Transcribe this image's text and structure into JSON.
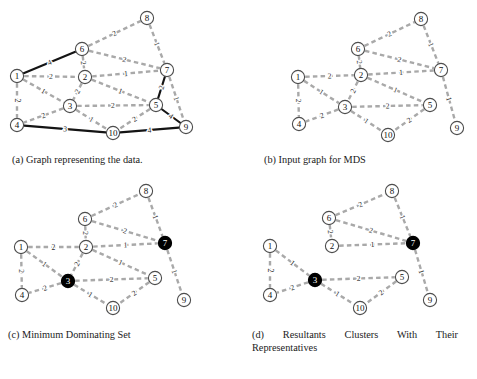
{
  "figure": {
    "colors": {
      "dashed_edge": "#a9a9a9",
      "solid_edge": "#141414",
      "node_fill": "#ffffff",
      "node_stroke": "#4d4d4d",
      "node_selected_fill": "#000000",
      "label_text": "#111111",
      "weight_text": "#2a2a2a",
      "background": "#ffffff"
    },
    "node_ids": [
      "1",
      "2",
      "3",
      "4",
      "5",
      "6",
      "7",
      "8",
      "9",
      "10"
    ]
  },
  "panels": [
    {
      "key": "a",
      "caption": "(a) Graph representing the data.",
      "selected_nodes": [],
      "nodes": [
        {
          "id": "1",
          "x": 17,
          "y": 76
        },
        {
          "id": "2",
          "x": 85,
          "y": 77
        },
        {
          "id": "3",
          "x": 70,
          "y": 106
        },
        {
          "id": "4",
          "x": 17,
          "y": 125
        },
        {
          "id": "5",
          "x": 156,
          "y": 105
        },
        {
          "id": "6",
          "x": 82,
          "y": 49
        },
        {
          "id": "7",
          "x": 167,
          "y": 70
        },
        {
          "id": "8",
          "x": 147,
          "y": 18
        },
        {
          "id": "9",
          "x": 186,
          "y": 127
        },
        {
          "id": "10",
          "x": 113,
          "y": 133
        }
      ],
      "edges": [
        {
          "from": "1",
          "to": "6",
          "w": "4",
          "style": "solid"
        },
        {
          "from": "1",
          "to": "2",
          "w": "2",
          "style": "dashed"
        },
        {
          "from": "1",
          "to": "3",
          "w": "1",
          "style": "dashed"
        },
        {
          "from": "1",
          "to": "4",
          "w": "2",
          "style": "dashed"
        },
        {
          "from": "6",
          "to": "2",
          "w": "2",
          "style": "dashed"
        },
        {
          "from": "6",
          "to": "8",
          "w": "2",
          "style": "dashed"
        },
        {
          "from": "6",
          "to": "7",
          "w": "2",
          "style": "dashed"
        },
        {
          "from": "8",
          "to": "7",
          "w": "1",
          "style": "dashed"
        },
        {
          "from": "2",
          "to": "7",
          "w": "1",
          "style": "dashed"
        },
        {
          "from": "2",
          "to": "3",
          "w": "2",
          "style": "dashed"
        },
        {
          "from": "2",
          "to": "5",
          "w": "1",
          "style": "dashed"
        },
        {
          "from": "3",
          "to": "5",
          "w": "2",
          "style": "dashed"
        },
        {
          "from": "3",
          "to": "4",
          "w": "2",
          "style": "dashed"
        },
        {
          "from": "3",
          "to": "10",
          "w": "1",
          "style": "dashed"
        },
        {
          "from": "5",
          "to": "10",
          "w": "2",
          "style": "dashed"
        },
        {
          "from": "5",
          "to": "7",
          "w": "2",
          "style": "solid"
        },
        {
          "from": "5",
          "to": "9",
          "w": "4",
          "style": "solid"
        },
        {
          "from": "7",
          "to": "9",
          "w": "1",
          "style": "dashed"
        },
        {
          "from": "4",
          "to": "10",
          "w": "3",
          "style": "solid"
        },
        {
          "from": "10",
          "to": "9",
          "w": "4",
          "style": "solid"
        }
      ]
    },
    {
      "key": "b",
      "caption": "(b) Input graph for MDS",
      "selected_nodes": [],
      "nodes": [
        {
          "id": "1",
          "x": 58,
          "y": 77
        },
        {
          "id": "2",
          "x": 121,
          "y": 75
        },
        {
          "id": "3",
          "x": 105,
          "y": 107
        },
        {
          "id": "4",
          "x": 59,
          "y": 124
        },
        {
          "id": "5",
          "x": 190,
          "y": 105
        },
        {
          "id": "6",
          "x": 118,
          "y": 49
        },
        {
          "id": "7",
          "x": 201,
          "y": 70
        },
        {
          "id": "8",
          "x": 181,
          "y": 19
        },
        {
          "id": "9",
          "x": 217,
          "y": 128
        },
        {
          "id": "10",
          "x": 148,
          "y": 135
        }
      ],
      "edges": [
        {
          "from": "1",
          "to": "2",
          "w": "2",
          "style": "dashed"
        },
        {
          "from": "1",
          "to": "3",
          "w": "1",
          "style": "dashed"
        },
        {
          "from": "1",
          "to": "4",
          "w": "2",
          "style": "dashed"
        },
        {
          "from": "6",
          "to": "2",
          "w": "2",
          "style": "dashed"
        },
        {
          "from": "6",
          "to": "8",
          "w": "2",
          "style": "dashed"
        },
        {
          "from": "6",
          "to": "7",
          "w": "2",
          "style": "dashed"
        },
        {
          "from": "8",
          "to": "7",
          "w": "1",
          "style": "dashed"
        },
        {
          "from": "2",
          "to": "7",
          "w": "1",
          "style": "dashed"
        },
        {
          "from": "2",
          "to": "3",
          "w": "2",
          "style": "dashed"
        },
        {
          "from": "2",
          "to": "5",
          "w": "1",
          "style": "dashed"
        },
        {
          "from": "3",
          "to": "5",
          "w": "2",
          "style": "dashed"
        },
        {
          "from": "3",
          "to": "4",
          "w": "2",
          "style": "dashed"
        },
        {
          "from": "3",
          "to": "10",
          "w": "1",
          "style": "dashed"
        },
        {
          "from": "5",
          "to": "10",
          "w": "2",
          "style": "dashed"
        },
        {
          "from": "7",
          "to": "9",
          "w": "1",
          "style": "dashed"
        }
      ]
    },
    {
      "key": "c",
      "caption": "(c) Minimum Dominating Set",
      "selected_nodes": [
        "3",
        "7"
      ],
      "nodes": [
        {
          "id": "1",
          "x": 21,
          "y": 247
        },
        {
          "id": "2",
          "x": 86,
          "y": 247
        },
        {
          "id": "3",
          "x": 68,
          "y": 281
        },
        {
          "id": "4",
          "x": 22,
          "y": 295
        },
        {
          "id": "5",
          "x": 155,
          "y": 278
        },
        {
          "id": "6",
          "x": 85,
          "y": 219
        },
        {
          "id": "7",
          "x": 165,
          "y": 243
        },
        {
          "id": "8",
          "x": 146,
          "y": 191
        },
        {
          "id": "9",
          "x": 184,
          "y": 300
        },
        {
          "id": "10",
          "x": 113,
          "y": 308
        }
      ],
      "edges": [
        {
          "from": "1",
          "to": "2",
          "w": "2",
          "style": "dashed"
        },
        {
          "from": "1",
          "to": "3",
          "w": "1",
          "style": "dashed"
        },
        {
          "from": "1",
          "to": "4",
          "w": "2",
          "style": "dashed"
        },
        {
          "from": "6",
          "to": "2",
          "w": "2",
          "style": "dashed"
        },
        {
          "from": "6",
          "to": "8",
          "w": "2",
          "style": "dashed"
        },
        {
          "from": "6",
          "to": "7",
          "w": "2",
          "style": "dashed"
        },
        {
          "from": "8",
          "to": "7",
          "w": "1",
          "style": "dashed"
        },
        {
          "from": "2",
          "to": "7",
          "w": "1",
          "style": "dashed"
        },
        {
          "from": "2",
          "to": "3",
          "w": "2",
          "style": "dashed"
        },
        {
          "from": "2",
          "to": "5",
          "w": "1",
          "style": "dashed"
        },
        {
          "from": "3",
          "to": "5",
          "w": "2",
          "style": "dashed"
        },
        {
          "from": "3",
          "to": "4",
          "w": "2",
          "style": "dashed"
        },
        {
          "from": "3",
          "to": "10",
          "w": "1",
          "style": "dashed"
        },
        {
          "from": "5",
          "to": "10",
          "w": "2",
          "style": "dashed"
        },
        {
          "from": "7",
          "to": "9",
          "w": "1",
          "style": "dashed"
        }
      ]
    },
    {
      "key": "d",
      "caption": "(d) Resultants Clusters With Their Representatives",
      "selected_nodes": [
        "3",
        "7"
      ],
      "nodes": [
        {
          "id": "1",
          "x": 30,
          "y": 246
        },
        {
          "id": "2",
          "x": 92,
          "y": 246
        },
        {
          "id": "3",
          "x": 75,
          "y": 280
        },
        {
          "id": "4",
          "x": 30,
          "y": 295
        },
        {
          "id": "5",
          "x": 162,
          "y": 277
        },
        {
          "id": "6",
          "x": 89,
          "y": 218
        },
        {
          "id": "7",
          "x": 173,
          "y": 243
        },
        {
          "id": "8",
          "x": 152,
          "y": 191
        },
        {
          "id": "9",
          "x": 190,
          "y": 300
        },
        {
          "id": "10",
          "x": 120,
          "y": 308
        }
      ],
      "edges": [
        {
          "from": "1",
          "to": "3",
          "w": "1",
          "style": "dashed"
        },
        {
          "from": "1",
          "to": "4",
          "w": "2",
          "style": "dashed"
        },
        {
          "from": "3",
          "to": "4",
          "w": "2",
          "style": "dashed"
        },
        {
          "from": "3",
          "to": "5",
          "w": "2",
          "style": "dashed"
        },
        {
          "from": "3",
          "to": "10",
          "w": "1",
          "style": "dashed"
        },
        {
          "from": "5",
          "to": "10",
          "w": "2",
          "style": "dashed"
        },
        {
          "from": "2",
          "to": "7",
          "w": "1",
          "style": "dashed"
        },
        {
          "from": "6",
          "to": "2",
          "w": "2",
          "style": "dashed"
        },
        {
          "from": "6",
          "to": "7",
          "w": "2",
          "style": "dashed"
        },
        {
          "from": "6",
          "to": "8",
          "w": "2",
          "style": "dashed"
        },
        {
          "from": "8",
          "to": "7",
          "w": "1",
          "style": "dashed"
        },
        {
          "from": "7",
          "to": "9",
          "w": "1",
          "style": "dashed"
        }
      ]
    }
  ]
}
